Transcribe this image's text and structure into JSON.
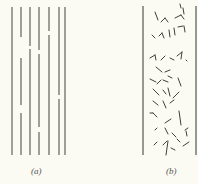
{
  "colors": {
    "background": "#fbfaf3",
    "line": "#6d6d6a",
    "ink": "#3f3f3c"
  },
  "panels": {
    "a": {
      "label": "(a)",
      "top": 7,
      "bottom": 155,
      "lines": [
        {
          "x": 12,
          "gaps": []
        },
        {
          "x": 21,
          "gaps": [
            [
              37,
              58
            ],
            [
              105,
              113
            ]
          ]
        },
        {
          "x": 30,
          "gaps": [
            [
              46,
              49
            ]
          ]
        },
        {
          "x": 39,
          "gaps": [
            [
              50,
              54
            ],
            [
              127,
              132
            ]
          ]
        },
        {
          "x": 49,
          "gaps": [
            [
              31,
              35
            ]
          ]
        },
        {
          "x": 59,
          "gaps": [
            [
              95,
              99
            ]
          ]
        },
        {
          "x": 65,
          "gaps": []
        }
      ]
    },
    "b": {
      "label": "(b)",
      "left": 143,
      "right": 196,
      "top": 6,
      "bottom": 155,
      "fragments": [
        [
          155,
          12,
          158,
          20
        ],
        [
          161,
          22,
          165,
          18
        ],
        [
          165,
          18,
          168,
          22
        ],
        [
          175,
          18,
          181,
          15
        ],
        [
          181,
          15,
          184,
          19
        ],
        [
          180,
          4,
          181,
          8
        ],
        [
          183,
          8,
          184,
          14
        ],
        [
          152,
          35,
          155,
          38
        ],
        [
          159,
          36,
          162,
          33
        ],
        [
          162,
          33,
          164,
          38
        ],
        [
          169,
          30,
          170,
          37
        ],
        [
          174,
          28,
          175,
          35
        ],
        [
          178,
          27,
          183,
          26
        ],
        [
          184,
          26,
          185,
          32
        ],
        [
          150,
          58,
          155,
          55
        ],
        [
          155,
          55,
          156,
          60
        ],
        [
          161,
          60,
          165,
          56
        ],
        [
          170,
          58,
          174,
          60
        ],
        [
          177,
          56,
          182,
          52
        ],
        [
          182,
          52,
          181,
          59
        ],
        [
          186,
          60,
          187,
          61
        ],
        [
          156,
          67,
          162,
          72
        ],
        [
          165,
          72,
          170,
          70
        ],
        [
          150,
          79,
          156,
          82
        ],
        [
          157,
          84,
          161,
          80
        ],
        [
          163,
          80,
          168,
          82
        ],
        [
          168,
          76,
          172,
          78
        ],
        [
          178,
          78,
          181,
          86
        ],
        [
          153,
          89,
          159,
          95
        ],
        [
          163,
          90,
          166,
          94
        ],
        [
          168,
          88,
          170,
          96
        ],
        [
          173,
          98,
          179,
          92
        ],
        [
          153,
          101,
          158,
          105
        ],
        [
          163,
          101,
          166,
          108
        ],
        [
          170,
          103,
          174,
          100
        ],
        [
          150,
          113,
          153,
          113
        ],
        [
          153,
          113,
          157,
          117
        ],
        [
          165,
          123,
          171,
          119
        ],
        [
          179,
          111,
          181,
          125
        ],
        [
          155,
          130,
          157,
          128
        ],
        [
          165,
          128,
          168,
          134
        ],
        [
          172,
          133,
          176,
          137
        ],
        [
          185,
          130,
          188,
          128
        ],
        [
          186,
          131,
          187,
          136
        ],
        [
          154,
          145,
          157,
          142
        ],
        [
          163,
          145,
          167,
          141
        ],
        [
          168,
          141,
          166,
          155
        ],
        [
          171,
          148,
          175,
          150
        ],
        [
          177,
          139,
          180,
          142
        ],
        [
          183,
          146,
          189,
          142
        ]
      ]
    }
  }
}
